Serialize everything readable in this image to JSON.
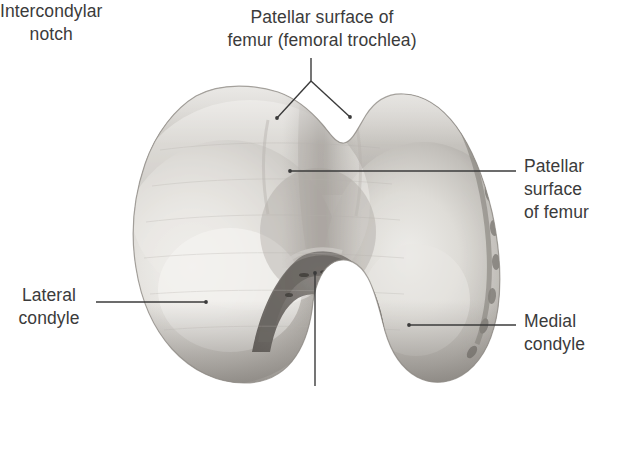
{
  "figure": {
    "background_color": "#ffffff",
    "text_color": "#3b3b3b",
    "leader_line_color": "#3b3b3b"
  },
  "labels": {
    "trochlea": "Patellar surface of\nfemur (femoral trochlea)",
    "patellar_right": "Patellar\nsurface\nof femur",
    "lateral_condyle": "Lateral\ncondyle",
    "medial_condyle": "Medial\ncondyle",
    "intercondylar_notch": "Intercondylar\nnotch"
  },
  "structures": [
    {
      "name": "patellar-surface-femoral-trochlea",
      "label_key": "trochlea"
    },
    {
      "name": "patellar-surface-of-femur",
      "label_key": "patellar_right"
    },
    {
      "name": "lateral-condyle",
      "label_key": "lateral_condyle"
    },
    {
      "name": "medial-condyle",
      "label_key": "medial_condyle"
    },
    {
      "name": "intercondylar-notch",
      "label_key": "intercondylar_notch"
    }
  ],
  "bone_palette": {
    "highlight": "#f2f1ee",
    "light": "#e2e0dc",
    "mid": "#c9c6c1",
    "shade": "#a9a5a0",
    "deep_shade": "#8b8782",
    "notch_dark": "#6f6b67",
    "rim_dark": "#6a6662",
    "outline": "#7d7975"
  }
}
